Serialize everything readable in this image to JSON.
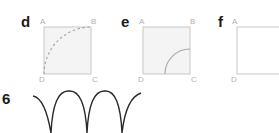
{
  "panels": [
    {
      "label": "d",
      "corners": {
        "a": "A",
        "b": "B",
        "c": "C",
        "d": "D"
      },
      "shape": "dashed quarter-circle arc centered at C"
    },
    {
      "label": "e",
      "corners": {
        "a": "A",
        "b": "B",
        "c": "C",
        "d": "D"
      },
      "shape": "solid small quarter-circle arc centered at C"
    },
    {
      "label": "f",
      "corners": {
        "a": "A",
        "d": "D"
      },
      "shape": "empty square (cropped)"
    }
  ],
  "question_number": "6",
  "colors": {
    "fill": "#f2f2f2",
    "stroke": "#c8c8c8",
    "arc": "#999999",
    "curve": "#2a2a2a"
  }
}
